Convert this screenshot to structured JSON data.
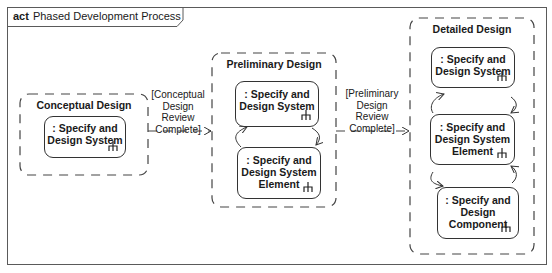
{
  "diagram": {
    "keyword": "act",
    "title": "Phased Development Process"
  },
  "regions": [
    {
      "name": "Conceptual Design",
      "actions": [
        ": Specify and\nDesign System"
      ]
    },
    {
      "name": "Preliminary Design",
      "actions": [
        ": Specify and\nDesign System",
        ": Specify and\nDesign System\nElement"
      ]
    },
    {
      "name": "Detailed Design",
      "actions": [
        ": Specify and\nDesign System",
        ": Specify and\nDesign System\nElement",
        ": Specify and\nDesign\nComponent"
      ]
    }
  ],
  "transitions": [
    {
      "from": "Conceptual Design",
      "to": "Preliminary Design",
      "guard": "[Conceptual\nDesign\nReview\nComplete]"
    },
    {
      "from": "Preliminary Design",
      "to": "Detailed Design",
      "guard": "[Preliminary\nDesign\nReview\nComplete]"
    }
  ],
  "colors": {
    "line": "#333333",
    "dashed": "#444444",
    "frame": "#5a5a5a",
    "background": "#ffffff"
  }
}
